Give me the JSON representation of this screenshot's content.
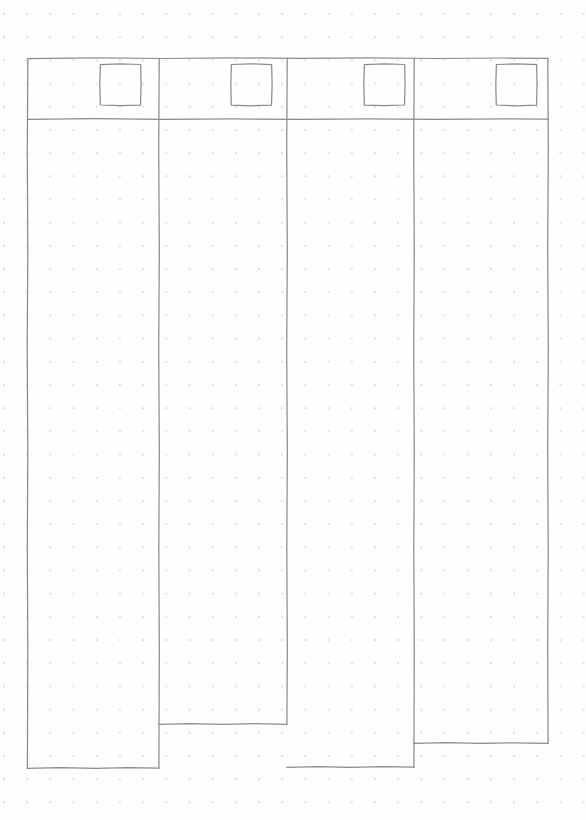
{
  "document": {
    "title": "Four Column Layout Wireframe",
    "medium": "dotted-grid-paper-sketch",
    "canvas_width": 586,
    "canvas_height": 820,
    "ink_color": "#8a8a92",
    "paper_color": "#fefefe",
    "dot_color": "#c9c9d2",
    "dot_spacing_px": 23
  },
  "frame": {
    "label": "Outer frame",
    "x": 27,
    "y": 58,
    "width": 521,
    "height": 710
  },
  "header": {
    "label": "Header band",
    "top": 58,
    "bottom": 119,
    "height": 61
  },
  "columns": [
    {
      "index": 1,
      "name": "column-one",
      "label": "Column 1",
      "left": 27,
      "right": 159,
      "width": 132,
      "top": 58,
      "bottom": 768,
      "height": 710,
      "placeholder": {
        "name": "placeholder-square-1",
        "label": "Square placeholder 1",
        "x": 100,
        "y": 64,
        "width": 41,
        "height": 41
      }
    },
    {
      "index": 2,
      "name": "column-two",
      "label": "Column 2",
      "left": 159,
      "right": 287,
      "width": 128,
      "top": 58,
      "bottom": 724,
      "height": 666,
      "placeholder": {
        "name": "placeholder-square-2",
        "label": "Square placeholder 2",
        "x": 231,
        "y": 64,
        "width": 41,
        "height": 41
      }
    },
    {
      "index": 3,
      "name": "column-three",
      "label": "Column 3",
      "left": 287,
      "right": 414,
      "width": 127,
      "top": 58,
      "bottom": 767,
      "height": 709,
      "placeholder": {
        "name": "placeholder-square-3",
        "label": "Square placeholder 3",
        "x": 364,
        "y": 64,
        "width": 41,
        "height": 41
      }
    },
    {
      "index": 4,
      "name": "column-four",
      "label": "Column 4",
      "left": 414,
      "right": 548,
      "width": 134,
      "top": 58,
      "bottom": 743,
      "height": 685,
      "placeholder": {
        "name": "placeholder-square-4",
        "label": "Square placeholder 4",
        "x": 496,
        "y": 64,
        "width": 41,
        "height": 41
      }
    }
  ]
}
